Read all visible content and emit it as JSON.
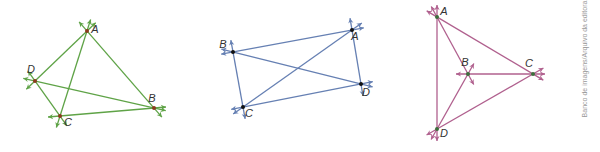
{
  "credit": "Banco de imagens/Arquivo da editora",
  "colors": {
    "green": "#5fa347",
    "green_point": "#8b3a1e",
    "blue": "#6680b3",
    "blue_point": "#111111",
    "pink": "#b0608e",
    "pink_point": "#3c6e3c"
  },
  "diagrams": [
    {
      "id": "diagram-1",
      "color": "green",
      "points": [
        {
          "label": "A",
          "x": 87,
          "y": 31
        },
        {
          "label": "B",
          "x": 154,
          "y": 108
        },
        {
          "label": "C",
          "x": 60,
          "y": 116
        },
        {
          "label": "D",
          "x": 35,
          "y": 81
        }
      ],
      "segments": [
        "AB",
        "AC",
        "AD",
        "BC",
        "BD",
        "CD"
      ]
    },
    {
      "id": "diagram-2",
      "color": "blue",
      "points": [
        {
          "label": "A",
          "x": 352,
          "y": 30
        },
        {
          "label": "B",
          "x": 233,
          "y": 52
        },
        {
          "label": "C",
          "x": 243,
          "y": 107
        },
        {
          "label": "D",
          "x": 361,
          "y": 84
        }
      ],
      "segments": [
        "AB",
        "AC",
        "AD",
        "BC",
        "BD",
        "CD"
      ]
    },
    {
      "id": "diagram-3",
      "color": "pink",
      "points": [
        {
          "label": "A",
          "x": 437,
          "y": 17
        },
        {
          "label": "B",
          "x": 468,
          "y": 74
        },
        {
          "label": "C",
          "x": 533,
          "y": 74
        },
        {
          "label": "D",
          "x": 437,
          "y": 129
        }
      ],
      "segments": [
        "AB",
        "AC",
        "AD",
        "BC",
        "BD",
        "CD"
      ]
    }
  ]
}
